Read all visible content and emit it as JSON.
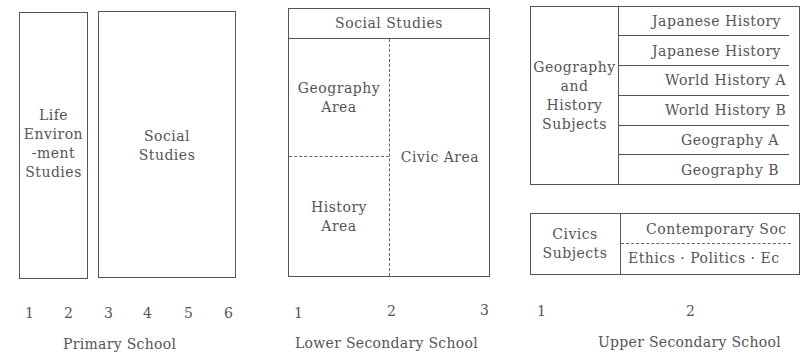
{
  "primary": {
    "life_env_lines": [
      "Life",
      "Environ",
      "-ment",
      "Studies"
    ],
    "social_lines": [
      "Social",
      "Studies"
    ],
    "grades": [
      "1",
      "2",
      "3",
      "4",
      "5",
      "6"
    ],
    "label": "Primary School"
  },
  "lower": {
    "header": "Social Studies",
    "geography_lines": [
      "Geography",
      "Area"
    ],
    "history_lines": [
      "History",
      "Area"
    ],
    "civic": "Civic Area",
    "grades": [
      "1",
      "2",
      "3"
    ],
    "label": "Lower Secondary School"
  },
  "upper": {
    "geo_hist_lines": [
      "Geography",
      "and",
      "History",
      "Subjects"
    ],
    "geo_hist_subjects": [
      "Japanese History",
      "Japanese History",
      "World History A",
      "World History B",
      "Geography A",
      "Geography B"
    ],
    "civics_lines": [
      "Civics",
      "Subjects"
    ],
    "civics_subjects": [
      "Contemporary Soc",
      "Ethics · Politics · Ec"
    ],
    "grades": [
      "1",
      "2"
    ],
    "label": "Upper Secondary School"
  }
}
